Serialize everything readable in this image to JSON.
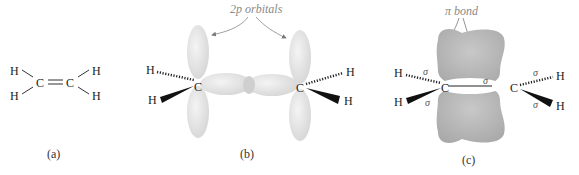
{
  "panels": [
    {
      "id": "a",
      "label": "(a)",
      "description": "Ethylene Lewis structure",
      "atoms": {
        "h1": "H",
        "h2": "H",
        "c1": "C",
        "c2": "C",
        "h3": "H",
        "h4": "H"
      }
    },
    {
      "id": "b",
      "label": "(b)",
      "annotation": "2p orbitals",
      "atoms": {
        "h1": "H",
        "h2": "H",
        "c1": "C",
        "c2": "C",
        "h3": "H",
        "h4": "H"
      }
    },
    {
      "id": "c",
      "label": "(c)",
      "annotation": "π bond",
      "sigma": "σ",
      "atoms": {
        "h1": "H",
        "h2": "H",
        "c1": "C",
        "c2": "C",
        "h3": "H",
        "h4": "H"
      }
    }
  ],
  "colors": {
    "orbital_fill": "#e6e6e6",
    "pi_cloud": "#b5b5b5",
    "text": "#222222",
    "annotation": "#8a8a8a"
  }
}
